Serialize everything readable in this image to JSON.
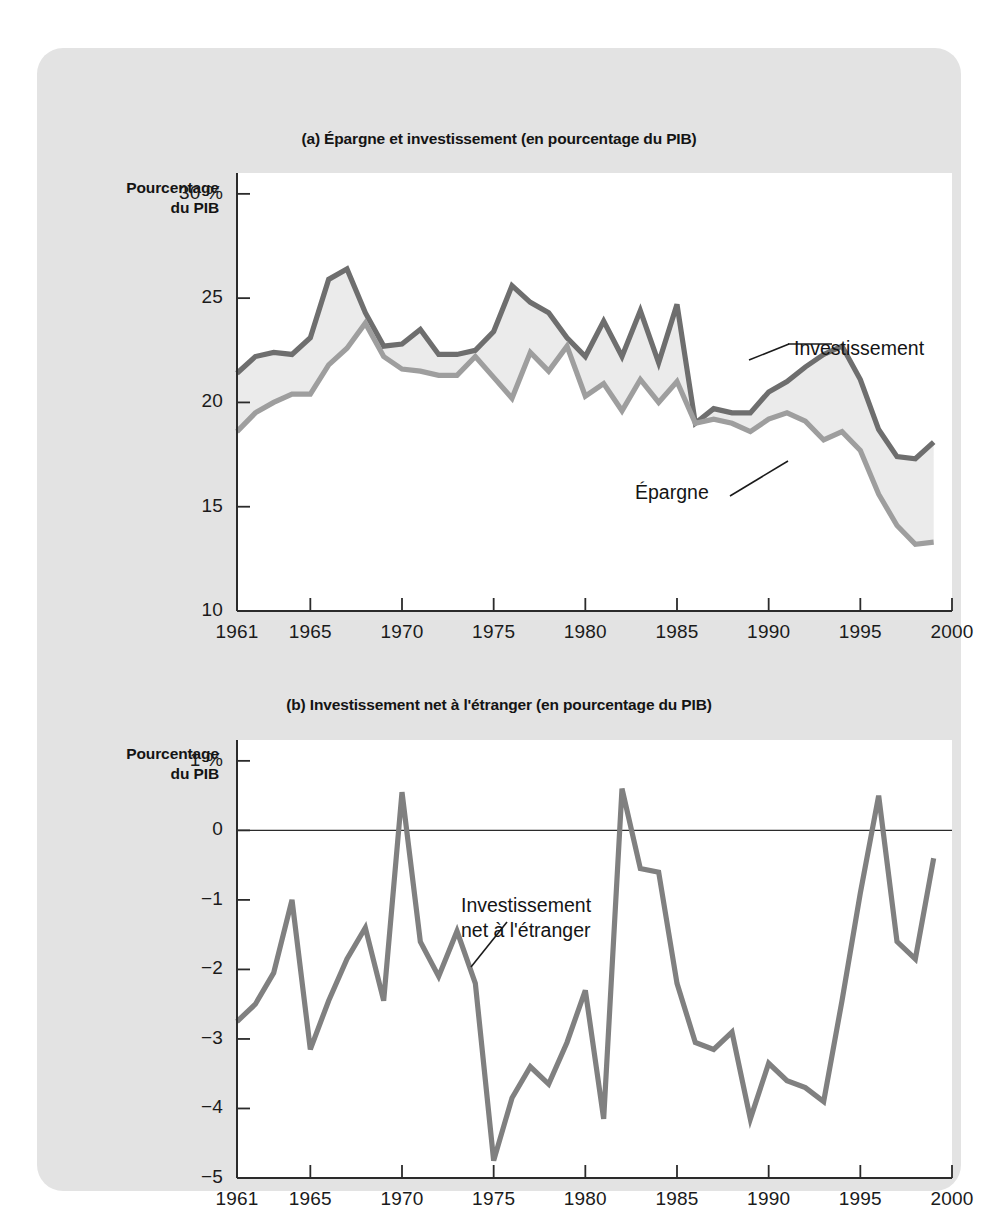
{
  "figure": {
    "charts": [
      {
        "id": "a",
        "title": "(a) Épargne et investissement (en pourcentage du PIB)",
        "axis_caption": "Pourcentage\ndu PIB",
        "labels": {
          "investissement": "Investissement",
          "epargne": "Épargne"
        }
      },
      {
        "id": "b",
        "title": "(b) Investissement net à l'étranger (en pourcentage du PIB)",
        "axis_caption": "Pourcentage\ndu PIB",
        "labels": {
          "ine": "Investissement\nnet à l'étranger"
        }
      }
    ],
    "colors": {
      "panel_background": "#e3e3e3",
      "plot_background": "#ffffff",
      "investment_line": "#6e6e6e",
      "saving_line": "#9e9e9e",
      "net_foreign_line": "#808080",
      "fill_between": "#ebebeb",
      "axis": "#2b2b2b",
      "text": "#141414"
    }
  },
  "chart_data": [
    {
      "type": "line",
      "id": "a",
      "title": "(a) Épargne et investissement (en pourcentage du PIB)",
      "xlabel": "",
      "ylabel": "Pourcentage du PIB",
      "xlim": [
        1961,
        2000
      ],
      "ylim": [
        10,
        31
      ],
      "yticks": [
        10,
        15,
        20,
        25,
        30
      ],
      "ytick_labels": [
        "10",
        "15",
        "20",
        "25",
        "30 %"
      ],
      "xticks": [
        1961,
        1965,
        1970,
        1975,
        1980,
        1985,
        1990,
        1995,
        2000
      ],
      "xtick_labels": [
        "1961",
        "1965",
        "1970",
        "1975",
        "1980",
        "1985",
        "1990",
        "1995",
        "2000"
      ],
      "grid": false,
      "legend": "inline-annotations",
      "x": [
        1961,
        1962,
        1963,
        1964,
        1965,
        1966,
        1967,
        1968,
        1969,
        1970,
        1971,
        1972,
        1973,
        1974,
        1975,
        1976,
        1977,
        1978,
        1979,
        1980,
        1981,
        1982,
        1983,
        1984,
        1985,
        1986,
        1987,
        1988,
        1989,
        1990,
        1991,
        1992,
        1993,
        1994,
        1995,
        1996,
        1997,
        1998,
        1999
      ],
      "series": [
        {
          "name": "Investissement",
          "color": "#6e6e6e",
          "values": [
            21.4,
            22.2,
            22.4,
            22.3,
            23.1,
            25.9,
            26.4,
            24.3,
            22.7,
            22.8,
            23.5,
            22.3,
            22.3,
            22.5,
            23.4,
            25.6,
            24.8,
            24.3,
            23.1,
            22.2,
            23.9,
            22.2,
            24.4,
            21.9,
            24.7,
            19.0,
            19.7,
            19.5,
            19.5,
            20.5,
            21.0,
            21.7,
            22.3,
            22.7,
            21.1,
            18.7,
            17.4,
            17.3,
            18.1,
            18.1,
            20.2,
            19.6,
            19.7
          ]
        },
        {
          "name": "Épargne",
          "color": "#9e9e9e",
          "values": [
            18.6,
            19.5,
            20.0,
            20.4,
            20.4,
            21.8,
            22.6,
            23.8,
            22.2,
            21.6,
            21.5,
            21.3,
            21.3,
            22.2,
            21.2,
            20.2,
            22.4,
            21.5,
            22.7,
            20.3,
            20.9,
            19.6,
            21.1,
            20.0,
            21.0,
            19.0,
            19.2,
            19.0,
            18.6,
            19.2,
            19.5,
            19.1,
            18.2,
            18.6,
            17.7,
            15.6,
            14.1,
            13.2,
            13.3,
            15.2,
            17.4,
            18.3,
            18.6,
            19.3
          ]
        }
      ]
    },
    {
      "type": "line",
      "id": "b",
      "title": "(b) Investissement net à l'étranger (en pourcentage du PIB)",
      "xlabel": "",
      "ylabel": "Pourcentage du PIB",
      "xlim": [
        1961,
        2000
      ],
      "ylim": [
        -5,
        1.3
      ],
      "yticks": [
        -5,
        -4,
        -3,
        -2,
        -1,
        0,
        1
      ],
      "ytick_labels": [
        "−5",
        "−4",
        "−3",
        "−2",
        "−1",
        "0",
        "1 %"
      ],
      "xticks": [
        1961,
        1965,
        1970,
        1975,
        1980,
        1985,
        1990,
        1995,
        2000
      ],
      "xtick_labels": [
        "1961",
        "1965",
        "1970",
        "1975",
        "1980",
        "1985",
        "1990",
        "1995",
        "2000"
      ],
      "grid": false,
      "zero_line": true,
      "legend": "inline-annotations",
      "x": [
        1961,
        1962,
        1963,
        1964,
        1965,
        1966,
        1967,
        1968,
        1969,
        1970,
        1971,
        1972,
        1973,
        1974,
        1975,
        1976,
        1977,
        1978,
        1979,
        1980,
        1981,
        1982,
        1983,
        1984,
        1985,
        1986,
        1987,
        1988,
        1989,
        1990,
        1991,
        1992,
        1993,
        1994,
        1995,
        1996,
        1997,
        1998,
        1999
      ],
      "series": [
        {
          "name": "Investissement net à l'étranger",
          "color": "#808080",
          "values": [
            -2.75,
            -2.5,
            -2.05,
            -1.0,
            -3.15,
            -2.45,
            -1.85,
            -1.4,
            -2.45,
            0.55,
            -1.6,
            -2.1,
            -1.45,
            -2.2,
            -4.75,
            -3.85,
            -3.4,
            -3.65,
            -3.05,
            -2.3,
            -4.15,
            0.6,
            -0.55,
            -0.6,
            -2.2,
            -3.05,
            -3.15,
            -2.9,
            -4.15,
            -3.35,
            -3.6,
            -3.7,
            -3.9,
            -2.45,
            -0.9,
            0.5,
            -1.6,
            -1.85,
            -0.4
          ]
        }
      ]
    }
  ]
}
